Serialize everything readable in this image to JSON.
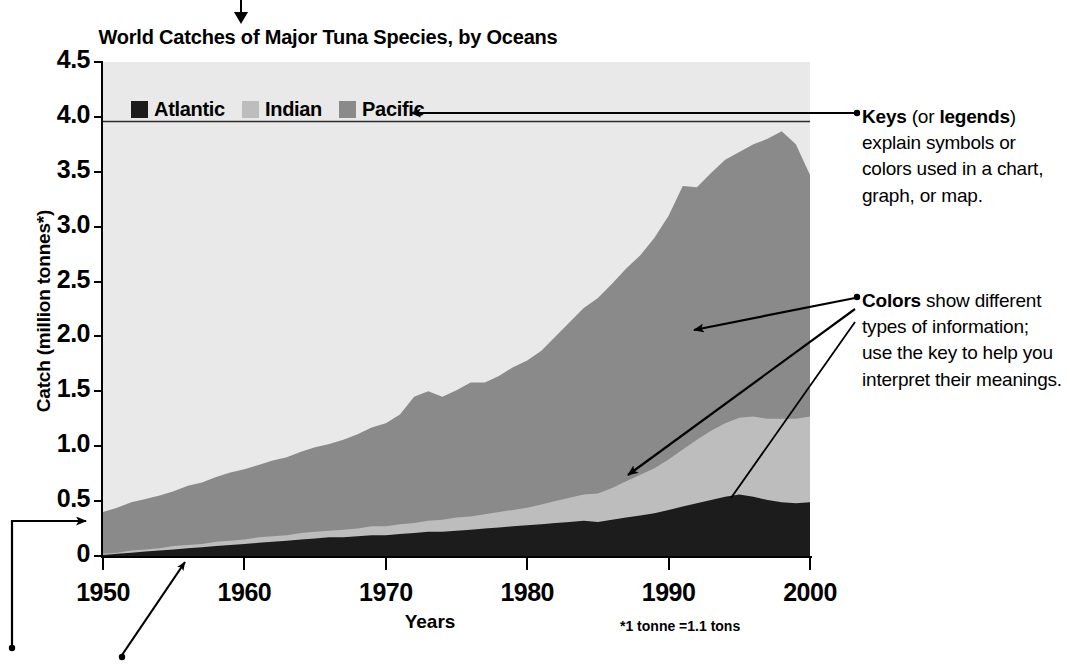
{
  "chart_data": {
    "type": "area",
    "title": "World Catches of Major Tuna Species, by Oceans",
    "xlabel": "Years",
    "ylabel": "Catch (million tonnes*)",
    "footnote": "*1 tonne =1.1 tons",
    "xlim": [
      1950,
      2000
    ],
    "ylim": [
      0,
      4.5
    ],
    "grid": false,
    "stacked": true,
    "legend_position": "inside-top-left",
    "plot_background": "#e9e9e9",
    "ytick_labels": [
      "0",
      "0.5",
      "1.0",
      "1.5",
      "2.0",
      "2.5",
      "3.0",
      "3.5",
      "4.0",
      "4.5"
    ],
    "ytick_values": [
      0,
      0.5,
      1.0,
      1.5,
      2.0,
      2.5,
      3.0,
      3.5,
      4.0,
      4.5
    ],
    "xtick_labels": [
      "1950",
      "1960",
      "1970",
      "1980",
      "1990",
      "2000"
    ],
    "xtick_values": [
      1950,
      1960,
      1970,
      1980,
      1990,
      2000
    ],
    "x": [
      1950,
      1951,
      1952,
      1953,
      1954,
      1955,
      1956,
      1957,
      1958,
      1959,
      1960,
      1961,
      1962,
      1963,
      1964,
      1965,
      1966,
      1967,
      1968,
      1969,
      1970,
      1971,
      1972,
      1973,
      1974,
      1975,
      1976,
      1977,
      1978,
      1979,
      1980,
      1981,
      1982,
      1983,
      1984,
      1985,
      1986,
      1987,
      1988,
      1989,
      1990,
      1991,
      1992,
      1993,
      1994,
      1995,
      1996,
      1997,
      1998,
      1999,
      2000
    ],
    "series": [
      {
        "name": "Atlantic",
        "color": "#1c1c1c",
        "values": [
          0.01,
          0.02,
          0.03,
          0.04,
          0.05,
          0.06,
          0.07,
          0.08,
          0.09,
          0.1,
          0.11,
          0.12,
          0.13,
          0.14,
          0.15,
          0.16,
          0.17,
          0.17,
          0.18,
          0.19,
          0.19,
          0.2,
          0.21,
          0.22,
          0.22,
          0.23,
          0.24,
          0.25,
          0.26,
          0.27,
          0.28,
          0.29,
          0.3,
          0.31,
          0.32,
          0.31,
          0.33,
          0.35,
          0.37,
          0.39,
          0.42,
          0.45,
          0.48,
          0.51,
          0.54,
          0.56,
          0.54,
          0.51,
          0.49,
          0.48,
          0.49
        ]
      },
      {
        "name": "Indian",
        "color": "#bdbdbd",
        "values": [
          0.01,
          0.01,
          0.02,
          0.02,
          0.02,
          0.03,
          0.03,
          0.03,
          0.04,
          0.04,
          0.04,
          0.05,
          0.05,
          0.05,
          0.06,
          0.06,
          0.06,
          0.07,
          0.07,
          0.08,
          0.08,
          0.09,
          0.09,
          0.1,
          0.11,
          0.12,
          0.12,
          0.13,
          0.14,
          0.15,
          0.16,
          0.18,
          0.2,
          0.22,
          0.24,
          0.26,
          0.29,
          0.33,
          0.37,
          0.41,
          0.46,
          0.52,
          0.58,
          0.63,
          0.67,
          0.7,
          0.73,
          0.74,
          0.76,
          0.77,
          0.78
        ]
      },
      {
        "name": "Pacific",
        "color": "#8a8a8a",
        "values": [
          0.38,
          0.41,
          0.44,
          0.46,
          0.48,
          0.5,
          0.54,
          0.56,
          0.59,
          0.62,
          0.64,
          0.66,
          0.69,
          0.71,
          0.74,
          0.77,
          0.79,
          0.82,
          0.86,
          0.9,
          0.94,
          1.0,
          1.15,
          1.18,
          1.12,
          1.16,
          1.22,
          1.2,
          1.24,
          1.3,
          1.34,
          1.4,
          1.5,
          1.6,
          1.7,
          1.78,
          1.86,
          1.94,
          2.0,
          2.1,
          2.22,
          2.4,
          2.3,
          2.35,
          2.4,
          2.42,
          2.48,
          2.55,
          2.62,
          2.5,
          2.2
        ]
      }
    ],
    "series_totals": [
      0.4,
      0.44,
      0.49,
      0.52,
      0.55,
      0.59,
      0.64,
      0.67,
      0.72,
      0.76,
      0.79,
      0.83,
      0.87,
      0.9,
      0.95,
      0.99,
      1.02,
      1.06,
      1.11,
      1.17,
      1.21,
      1.29,
      1.45,
      1.5,
      1.45,
      1.51,
      1.58,
      1.58,
      1.64,
      1.72,
      1.78,
      1.87,
      2.0,
      2.13,
      2.26,
      2.35,
      2.48,
      2.62,
      2.74,
      2.9,
      3.1,
      3.37,
      3.36,
      3.49,
      3.61,
      3.68,
      3.75,
      3.8,
      3.87,
      3.75,
      3.47
    ]
  },
  "legend": {
    "items": [
      {
        "label": "Atlantic",
        "color": "#1c1c1c"
      },
      {
        "label": "Indian",
        "color": "#bdbdbd"
      },
      {
        "label": "Pacific",
        "color": "#8a8a8a"
      }
    ]
  },
  "annotations": [
    {
      "id": "keys",
      "html": "<b>Keys</b> (or <b>legends</b>) explain symbols or colors used in a chart, graph, or map."
    },
    {
      "id": "colors",
      "html": "<b>Colors</b> show different types of information; use the key to help you interpret their meanings."
    }
  ]
}
